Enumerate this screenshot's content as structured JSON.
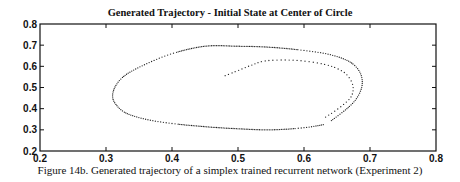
{
  "figure": {
    "title": "Generated Trajectory - Initial State at Center of Circle",
    "caption": "Figure 14b. Generated trajectory of a simplex trained recurrent network (Experiment 2)"
  },
  "chart_data": {
    "type": "scatter",
    "title": "Generated Trajectory - Initial State at Center of Circle",
    "xlabel": "",
    "ylabel": "",
    "xlim": [
      0.2,
      0.8
    ],
    "ylim": [
      0.2,
      0.8
    ],
    "xticks": [
      0.2,
      0.3,
      0.4,
      0.5,
      0.6,
      0.7,
      0.8
    ],
    "yticks": [
      0.2,
      0.3,
      0.4,
      0.5,
      0.6,
      0.7,
      0.8
    ],
    "xtick_labels": [
      "0.2",
      "0.3",
      "0.4",
      "0.5",
      "0.6",
      "0.7",
      "0.8"
    ],
    "ytick_labels": [
      "0.2",
      "0.3",
      "0.4",
      "0.5",
      "0.6",
      "0.7",
      "0.8"
    ],
    "grid": false,
    "legend": null,
    "marker": "dotted trajectory",
    "series": [
      {
        "name": "trajectory (inner spiral from start)",
        "x": [
          0.48,
          0.5,
          0.52,
          0.54,
          0.57,
          0.6,
          0.63,
          0.65,
          0.665,
          0.674,
          0.672,
          0.66,
          0.645,
          0.63
        ],
        "y": [
          0.555,
          0.58,
          0.605,
          0.625,
          0.63,
          0.625,
          0.61,
          0.59,
          0.56,
          0.51,
          0.46,
          0.42,
          0.385,
          0.355
        ]
      },
      {
        "name": "trajectory (limit cycle)",
        "x": [
          0.63,
          0.6,
          0.55,
          0.5,
          0.45,
          0.4,
          0.36,
          0.33,
          0.315,
          0.31,
          0.315,
          0.33,
          0.36,
          0.4,
          0.45,
          0.5,
          0.55,
          0.6,
          0.64,
          0.67,
          0.685,
          0.688,
          0.68,
          0.665,
          0.64
        ],
        "y": [
          0.325,
          0.31,
          0.3,
          0.305,
          0.315,
          0.33,
          0.35,
          0.38,
          0.42,
          0.46,
          0.51,
          0.56,
          0.61,
          0.66,
          0.695,
          0.695,
          0.69,
          0.675,
          0.655,
          0.62,
          0.57,
          0.51,
          0.45,
          0.4,
          0.34
        ]
      }
    ]
  }
}
